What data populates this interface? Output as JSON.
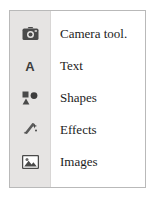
{
  "panel": {
    "name": "tool-menu-panel",
    "background": "#ffffff",
    "border_color": "#b9b9b9",
    "rail_color": "#e6e4e3"
  },
  "menu": {
    "items": [
      {
        "icon": "camera-icon",
        "label": "Camera tool."
      },
      {
        "icon": "text-a-icon",
        "label": "Text"
      },
      {
        "icon": "shapes-icon",
        "label": "Shapes"
      },
      {
        "icon": "effects-wand-icon",
        "label": "Effects"
      },
      {
        "icon": "images-picture-icon",
        "label": "Images"
      }
    ]
  },
  "colors": {
    "icon_fill": "#4a4a4a",
    "text": "#1c1c1c",
    "rail": "#e6e4e3",
    "border": "#b9b9b9"
  }
}
